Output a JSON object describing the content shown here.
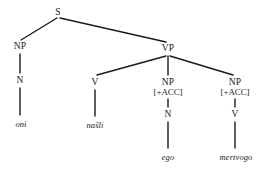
{
  "diagram": {
    "type": "syntax-tree",
    "title": "",
    "background_color": "#ffffff",
    "line_color": "#1a1a1a",
    "text_color": "#1a1a1a",
    "sentence": "oni naŝli ego mertvogo",
    "nodes": [
      {
        "id": "s",
        "label": "S",
        "feature": "",
        "x": 58,
        "y": 8
      },
      {
        "id": "np1",
        "label": "NP",
        "feature": "",
        "x": 20,
        "y": 42
      },
      {
        "id": "vp",
        "label": "VP",
        "feature": "",
        "x": 168,
        "y": 44
      },
      {
        "id": "n1",
        "label": "N",
        "feature": "",
        "x": 20,
        "y": 76
      },
      {
        "id": "v1",
        "label": "V",
        "feature": "",
        "x": 95,
        "y": 78
      },
      {
        "id": "np2",
        "label": "NP",
        "feature": "[+ACC]",
        "x": 168,
        "y": 78
      },
      {
        "id": "np3",
        "label": "NP",
        "feature": "[+ACC]",
        "x": 235,
        "y": 78
      },
      {
        "id": "n2",
        "label": "N",
        "feature": "",
        "x": 168,
        "y": 110
      },
      {
        "id": "v2",
        "label": "V",
        "feature": "",
        "x": 235,
        "y": 110
      }
    ],
    "leaves": [
      {
        "id": "leaf1",
        "label": "oni",
        "x": 21,
        "y": 119
      },
      {
        "id": "leaf2",
        "label": "naŝli",
        "x": 95,
        "y": 120
      },
      {
        "id": "leaf3",
        "label": "ego",
        "x": 168,
        "y": 152
      },
      {
        "id": "leaf4",
        "label": "mertvogo",
        "x": 236,
        "y": 152
      }
    ],
    "edges": [
      {
        "from": "s",
        "to": "np1",
        "x1": 57,
        "y1": 18,
        "x2": 21,
        "y2": 40
      },
      {
        "from": "s",
        "to": "vp",
        "x1": 60,
        "y1": 18,
        "x2": 166,
        "y2": 42
      },
      {
        "from": "np1",
        "to": "n1",
        "x1": 20,
        "y1": 54,
        "x2": 20,
        "y2": 73
      },
      {
        "from": "n1",
        "to": "leaf1",
        "x1": 20,
        "y1": 88,
        "x2": 20,
        "y2": 115
      },
      {
        "from": "vp",
        "to": "v1",
        "x1": 166,
        "y1": 56,
        "x2": 97,
        "y2": 75
      },
      {
        "from": "vp",
        "to": "np2",
        "x1": 168,
        "y1": 56,
        "x2": 168,
        "y2": 75
      },
      {
        "from": "vp",
        "to": "np3",
        "x1": 170,
        "y1": 56,
        "x2": 233,
        "y2": 75
      },
      {
        "from": "v1",
        "to": "leaf2",
        "x1": 95,
        "y1": 90,
        "x2": 95,
        "y2": 116
      },
      {
        "from": "np2",
        "to": "n2",
        "x1": 168,
        "y1": 99,
        "x2": 168,
        "y2": 107
      },
      {
        "from": "np3",
        "to": "v2",
        "x1": 235,
        "y1": 99,
        "x2": 235,
        "y2": 107
      },
      {
        "from": "n2",
        "to": "leaf3",
        "x1": 168,
        "y1": 122,
        "x2": 168,
        "y2": 148
      },
      {
        "from": "v2",
        "to": "leaf4",
        "x1": 235,
        "y1": 122,
        "x2": 235,
        "y2": 148
      }
    ]
  }
}
